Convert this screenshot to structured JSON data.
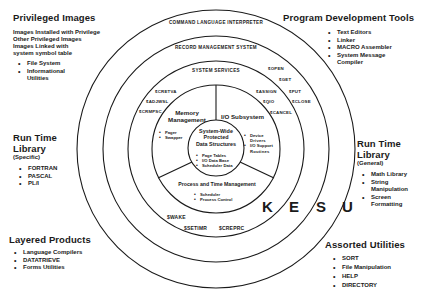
{
  "corners": {
    "top_left": {
      "title": "Privileged Images",
      "lines": [
        "Images Installed with Privilege",
        "Other Privileged Images",
        "Images Linked with",
        "system symbol table"
      ],
      "bullets": [
        "File System",
        "Informational",
        "Utilities"
      ]
    },
    "top_right": {
      "title": "Program Development Tools",
      "bullets": [
        "Text Editors",
        "Linker",
        "MACRO Assembler",
        "System Message",
        "Compiler"
      ]
    },
    "mid_left": {
      "title_line1": "Run Time",
      "title_line2": "Library",
      "subtitle": "(Specific)",
      "bullets": [
        "FORTRAN",
        "PASCAL",
        "PL/I"
      ]
    },
    "mid_right": {
      "title_line1": "Run Time",
      "title_line2": "Library",
      "subtitle": "(General)",
      "bullets": [
        "Math Library",
        "String",
        "Manipulation",
        "Screen",
        "Formatting"
      ]
    },
    "bottom_left": {
      "title": "Layered Products",
      "bullets": [
        "Language Compilers",
        "DATATRIEVE",
        "Forms Utilities"
      ]
    },
    "bottom_right": {
      "title": "Assorted Utilities",
      "bullets": [
        "SORT",
        "File Manipulation",
        "HELP",
        "DIRECTORY"
      ]
    }
  },
  "rings": {
    "outer": "COMMAND LANGUAGE INTERPRETER",
    "second": "RECORD MANAGEMENT SYSTEM",
    "third": "SYSTEM SERVICES"
  },
  "system_services": {
    "left": [
      "$CRETVA",
      "$ADJWSL",
      "$CRMPSC"
    ],
    "right_inner": [
      "$ASSIGN",
      "$QIO",
      "$CANCEL"
    ],
    "right_outer": [
      "$OPEN",
      "$GET",
      "$PUT",
      "$CLOSE"
    ],
    "bottom": [
      "$WAKE",
      "$SETIMR",
      "$CREPRC"
    ]
  },
  "sections": {
    "memory": {
      "title_line1": "Memory",
      "title_line2": "Management",
      "bullets": [
        "Pager",
        "Swapper"
      ]
    },
    "io": {
      "title": "I/O Subsystem",
      "bullets": [
        "Device",
        "Drivers",
        "I/O Support",
        "Routines"
      ]
    },
    "process": {
      "title": "Process and Time Management",
      "bullets": [
        "Scheduler",
        "Process Control"
      ]
    },
    "core": {
      "title_line1": "System-Wide",
      "title_line2": "Protected",
      "title_line3": "Data Structures",
      "bullets": [
        "Page Tables",
        "I/O Data Base",
        "Scheduler Data"
      ]
    }
  },
  "mode_letters": [
    "K",
    "E",
    "S",
    "U"
  ],
  "colors": {
    "ink": "#1a1a1a",
    "background": "#ffffff"
  }
}
